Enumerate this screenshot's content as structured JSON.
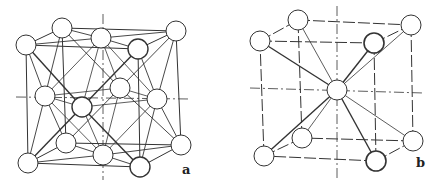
{
  "figure": {
    "panels": [
      {
        "id": "a",
        "label": "a",
        "description": "face-centered cubic unit cell",
        "label_pos": [
          182,
          162
        ],
        "atom_radius": 10,
        "atoms": {
          "btl": [
            62,
            28
          ],
          "btr": [
            176,
            31
          ],
          "ftl": [
            26,
            45
          ],
          "ftr": [
            138,
            49
          ],
          "bbl": [
            66,
            143
          ],
          "bbr": [
            181,
            145
          ],
          "fbl": [
            28,
            163
          ],
          "fbr": [
            140,
            167
          ],
          "top": [
            101,
            38
          ],
          "left": [
            45,
            96
          ],
          "front": [
            82,
            107
          ],
          "back": [
            120,
            88
          ],
          "right": [
            157,
            99
          ],
          "bottom": [
            103,
            155
          ]
        },
        "axes": {
          "vertical": [
            [
              103,
              14
            ],
            [
              103,
              180
            ]
          ],
          "horizontal": [
            [
              16,
              97
            ],
            [
              190,
              99
            ]
          ]
        }
      },
      {
        "id": "b",
        "label": "b",
        "description": "body-centered cubic unit cell",
        "label_pos": [
          416,
          155
        ],
        "atom_radius": 10,
        "atoms": {
          "btl": [
            298,
            20
          ],
          "btr": [
            411,
            25
          ],
          "ftl": [
            260,
            41
          ],
          "ftr": [
            374,
            43
          ],
          "bbl": [
            302,
            138
          ],
          "bbr": [
            413,
            141
          ],
          "fbl": [
            264,
            156
          ],
          "fbr": [
            376,
            161
          ],
          "center": [
            337,
            90
          ]
        },
        "axes": {
          "vertical": [
            [
              337,
              6
            ],
            [
              337,
              180
            ]
          ],
          "horizontal": [
            [
              250,
              88
            ],
            [
              424,
              93
            ]
          ]
        }
      }
    ],
    "colors": {
      "line": "#333333",
      "atom_fill": "#ffffff",
      "atom_stroke": "#333333",
      "label": "#222222"
    }
  }
}
